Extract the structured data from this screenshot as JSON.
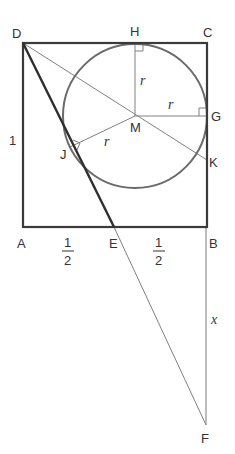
{
  "diagram": {
    "colors": {
      "thick_line": "#333333",
      "thin_line": "#777777",
      "circle": "#666666",
      "text": "#333333"
    },
    "points": {
      "D": {
        "label": "D",
        "x": 23,
        "y": 43
      },
      "C": {
        "label": "C",
        "x": 207,
        "y": 43
      },
      "A": {
        "label": "A",
        "x": 23,
        "y": 227
      },
      "B": {
        "label": "B",
        "x": 207,
        "y": 227
      },
      "E": {
        "label": "E",
        "x": 114,
        "y": 227
      },
      "H": {
        "label": "H",
        "x": 135,
        "y": 43
      },
      "G": {
        "label": "G",
        "x": 207,
        "y": 116
      },
      "M": {
        "label": "M",
        "x": 135,
        "y": 116
      },
      "J": {
        "label": "J",
        "x": 70,
        "y": 147
      },
      "K": {
        "label": "K",
        "x": 207,
        "y": 160
      },
      "F": {
        "label": "F",
        "x": 206,
        "y": 425
      }
    },
    "circle": {
      "cx": 135,
      "cy": 116,
      "r": 72
    },
    "segment_labels": {
      "AD": "1",
      "AE_num": "1",
      "AE_den": "2",
      "EB_num": "1",
      "EB_den": "2",
      "MH": "r",
      "MG": "r",
      "MJ": "r",
      "BF": "x"
    }
  }
}
